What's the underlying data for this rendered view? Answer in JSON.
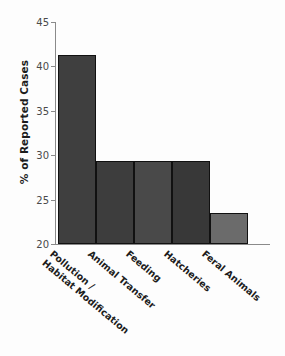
{
  "chart_data": {
    "type": "bar",
    "title": "",
    "xlabel": "",
    "ylabel": "% of Reported Cases",
    "categories": [
      "Pollution / Habitat Modification",
      "Animal Transfer",
      "Feeding",
      "Hatcheries",
      "Feral Animals"
    ],
    "category_lines": [
      [
        "Pollution /",
        "Habitat Modification"
      ],
      [
        "Animal Transfer",
        ""
      ],
      [
        "Feeding",
        ""
      ],
      [
        "Hatcheries",
        ""
      ],
      [
        "Feral Animals",
        ""
      ]
    ],
    "values": [
      41.3,
      29.4,
      29.4,
      29.4,
      23.5
    ],
    "ylim": [
      20,
      45
    ],
    "yticks": [
      20,
      25,
      30,
      35,
      40,
      45
    ],
    "ytick_labels": [
      "20",
      "25",
      "30",
      "35",
      "40",
      "45"
    ],
    "grid": false,
    "legend": false,
    "bar_colors": [
      "#3f3f3f",
      "#3d3d3d",
      "#494949",
      "#383838",
      "#6b6b6b"
    ],
    "bar_edge_color": "#111111",
    "axis_color": "#8a8a8a",
    "background": "#fdfdfd",
    "text_color": "#1c1c1c"
  }
}
